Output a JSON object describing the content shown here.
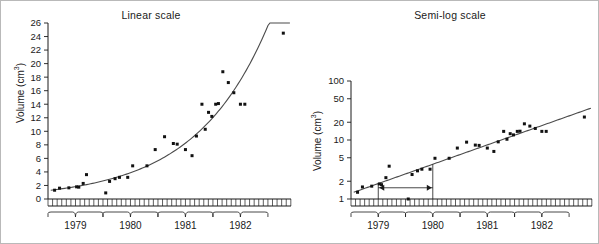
{
  "figure": {
    "background": "#ffffff",
    "frame_color": "#b9b9b9",
    "point_color": "#111111",
    "line_color": "#4b4b4b"
  },
  "panels": {
    "linear": {
      "title": "Linear scale",
      "ylabel_text": "Volume (cm",
      "ylabel_sup": "3",
      "ylabel_close": ")"
    },
    "semilog": {
      "title": "Semi-log scale",
      "ylabel_text": "Volume (cm",
      "ylabel_sup": "3",
      "ylabel_close": ")"
    }
  },
  "chart_data": [
    {
      "type": "scatter",
      "title": "Linear scale",
      "xlabel": "",
      "ylabel": "Volume (cm^3)",
      "yscale": "linear",
      "ylim": [
        0,
        26
      ],
      "yticks": [
        0,
        2,
        4,
        6,
        8,
        10,
        12,
        14,
        16,
        18,
        20,
        22,
        24,
        26
      ],
      "ytick_labels": [
        "0",
        "2",
        "4",
        "6",
        "8",
        "10",
        "12",
        "14",
        "16",
        "18",
        "20",
        "22",
        "24",
        "26"
      ],
      "xlim": [
        1978.5,
        1982.92
      ],
      "xtick_labels": [
        "1979",
        "1980",
        "1981",
        "1982"
      ],
      "x_minor_ticks": "monthly",
      "grid": false,
      "legend": null,
      "x": [
        1978.62,
        1978.71,
        1978.88,
        1979.02,
        1979.06,
        1979.14,
        1979.2,
        1979.55,
        1979.62,
        1979.72,
        1979.8,
        1979.95,
        1980.04,
        1980.3,
        1980.45,
        1980.62,
        1980.78,
        1980.85,
        1981.0,
        1981.12,
        1981.2,
        1981.3,
        1981.36,
        1981.42,
        1981.48,
        1981.55,
        1981.6,
        1981.68,
        1981.78,
        1981.88,
        1982.0,
        1982.08,
        1982.78
      ],
      "y": [
        1.3,
        1.6,
        1.65,
        1.8,
        1.75,
        2.3,
        3.6,
        0.9,
        2.6,
        3.0,
        3.2,
        3.2,
        4.9,
        4.9,
        7.3,
        9.2,
        8.2,
        8.1,
        7.3,
        6.4,
        9.3,
        14.0,
        10.3,
        12.8,
        12.2,
        14.0,
        14.1,
        18.8,
        17.2,
        15.7,
        14.0,
        14.0,
        24.5
      ],
      "fit_curve": {
        "model": "exponential",
        "description": "smooth exponential growth curve through points"
      }
    },
    {
      "type": "scatter",
      "title": "Semi-log scale",
      "xlabel": "",
      "ylabel": "Volume (cm^3)",
      "yscale": "log",
      "ylim": [
        1,
        100
      ],
      "yticks": [
        1,
        2,
        5,
        10,
        20,
        50,
        100
      ],
      "ytick_labels": [
        "1",
        "2",
        "5",
        "10",
        "20",
        "50",
        "100"
      ],
      "xlim": [
        1978.5,
        1982.92
      ],
      "xtick_labels": [
        "1979",
        "1980",
        "1981",
        "1982"
      ],
      "x_minor_ticks": "monthly",
      "grid": false,
      "legend": null,
      "x": [
        1978.62,
        1978.71,
        1978.88,
        1979.02,
        1979.06,
        1979.14,
        1979.2,
        1979.55,
        1979.62,
        1979.72,
        1979.8,
        1979.95,
        1980.04,
        1980.3,
        1980.45,
        1980.62,
        1980.78,
        1980.85,
        1981.0,
        1981.12,
        1981.2,
        1981.3,
        1981.36,
        1981.42,
        1981.48,
        1981.55,
        1981.6,
        1981.68,
        1981.78,
        1981.88,
        1982.0,
        1982.08,
        1982.78
      ],
      "y": [
        1.3,
        1.6,
        1.65,
        1.8,
        1.75,
        2.3,
        3.6,
        0.9,
        2.6,
        3.0,
        3.2,
        3.2,
        4.9,
        4.9,
        7.3,
        9.2,
        8.2,
        8.1,
        7.3,
        6.4,
        9.3,
        14.0,
        10.3,
        12.8,
        12.2,
        14.0,
        14.1,
        18.8,
        17.2,
        15.7,
        14.0,
        14.0,
        24.5
      ],
      "fit_curve": {
        "model": "log-linear",
        "description": "straight regression line on log axis"
      },
      "annotation": {
        "type": "double-headed-arrow",
        "label": "",
        "x_start": 1979.0,
        "x_end": 1980.0,
        "y_level": 1.55,
        "description": "doubling-time interval marked between two vertical reference bars"
      }
    }
  ]
}
